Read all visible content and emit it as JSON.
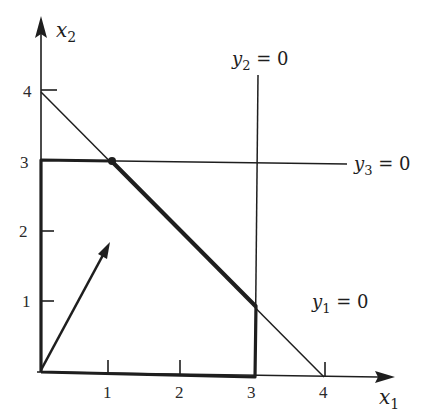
{
  "diagram": {
    "type": "linear-programming-feasible-region",
    "axes": {
      "x": {
        "label": "x",
        "subscript": "1",
        "ticks": [
          "1",
          "2",
          "3",
          "4"
        ]
      },
      "y": {
        "label": "x",
        "subscript": "2",
        "ticks": [
          "1",
          "2",
          "3",
          "4"
        ]
      }
    },
    "constraints": [
      {
        "name": "y1",
        "label_var": "y",
        "label_sub": "1",
        "label_rest": " = 0",
        "equation": "x1 + x2 = 4"
      },
      {
        "name": "y2",
        "label_var": "y",
        "label_sub": "2",
        "label_rest": " = 0",
        "equation": "x1 = 3"
      },
      {
        "name": "y3",
        "label_var": "y",
        "label_sub": "3",
        "label_rest": " = 0",
        "equation": "x2 = 3"
      }
    ],
    "feasible_region_vertices": [
      [
        0,
        0
      ],
      [
        3,
        0
      ],
      [
        3,
        1
      ],
      [
        1,
        3
      ],
      [
        0,
        3
      ]
    ],
    "highlighted_point": [
      1,
      3
    ],
    "direction_arrow": {
      "from": [
        0,
        0
      ],
      "to": [
        1,
        1.8
      ]
    },
    "colors": {
      "ink": "#1e1e1e",
      "background": "#ffffff"
    }
  }
}
